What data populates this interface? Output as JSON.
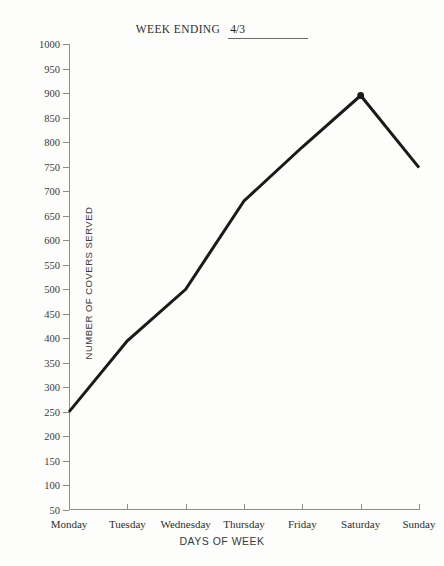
{
  "header": {
    "title_label": "WEEK ENDING",
    "title_value": "4/3"
  },
  "chart_data": {
    "type": "line",
    "title": "WEEK ENDING 4/3",
    "xlabel": "DAYS OF WEEK",
    "ylabel": "NUMBER OF COVERS SERVED",
    "categories": [
      "Monday",
      "Tuesday",
      "Wednesday",
      "Thursday",
      "Friday",
      "Saturday",
      "Sunday"
    ],
    "values": [
      250,
      395,
      500,
      680,
      790,
      895,
      748
    ],
    "series": [
      {
        "name": "Covers served",
        "values": [
          250,
          395,
          500,
          680,
          790,
          895,
          748
        ]
      }
    ],
    "ylim": [
      50,
      1000
    ],
    "ytick_step": 50,
    "yticks": [
      1000,
      950,
      900,
      850,
      800,
      750,
      700,
      650,
      600,
      550,
      500,
      450,
      400,
      350,
      300,
      250,
      200,
      150,
      100,
      50
    ],
    "grid": false,
    "legend": false,
    "line_color": "#1a1a1a",
    "axis_color": "#8c8c8c",
    "background": "#fdfdfb",
    "marker_points": [
      "Saturday"
    ]
  }
}
